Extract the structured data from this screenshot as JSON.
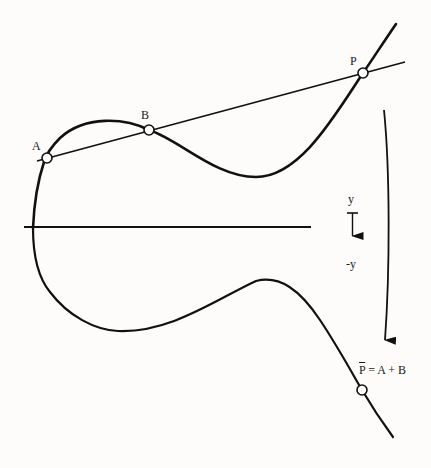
{
  "diagram": {
    "colors": {
      "background": "#fdfcfa",
      "stroke": "#111111",
      "point_fill": "#ffffff"
    },
    "points": [
      {
        "id": "A",
        "label": "A",
        "x": 47,
        "y": 158
      },
      {
        "id": "B",
        "label": "B",
        "x": 149,
        "y": 130
      },
      {
        "id": "P",
        "label": "P",
        "x": 363,
        "y": 73
      },
      {
        "id": "Pbar",
        "label": "P",
        "x": 362,
        "y": 390
      }
    ],
    "reflection_axis": {
      "top_label": "y",
      "bottom_label": "-y"
    },
    "result_label": {
      "symbol": "P",
      "equation": " = A + B"
    }
  }
}
